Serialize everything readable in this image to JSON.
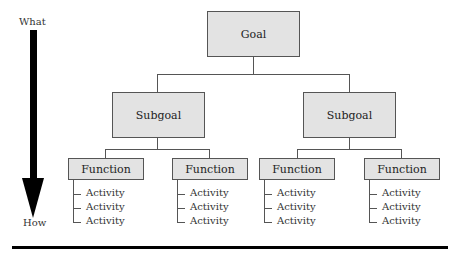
{
  "diagram": {
    "axis": {
      "top_label": "What",
      "bottom_label": "How",
      "arrow_color": "#000000"
    },
    "goal": {
      "label": "Goal"
    },
    "subgoals": [
      {
        "label": "Subgoal"
      },
      {
        "label": "Subgoal"
      }
    ],
    "functions": [
      {
        "label": "Function",
        "activities": [
          "Activity",
          "Activity",
          "Activity"
        ]
      },
      {
        "label": "Function",
        "activities": [
          "Activity",
          "Activity",
          "Activity"
        ]
      },
      {
        "label": "Function",
        "activities": [
          "Activity",
          "Activity",
          "Activity"
        ]
      },
      {
        "label": "Function",
        "activities": [
          "Activity",
          "Activity",
          "Activity"
        ]
      }
    ],
    "colors": {
      "box_fill": "#e3e3e3",
      "box_border": "#555555",
      "connector": "#555555",
      "rule": "#000000"
    }
  }
}
